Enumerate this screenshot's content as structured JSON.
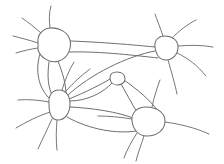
{
  "figure": {
    "kind": "line-drawing",
    "width": 224,
    "height": 164,
    "background_color": "#ffffff",
    "ink_color": "#6e6e70",
    "stroke_width": 1.05
  },
  "nodes": [
    {
      "id": "node-top-left",
      "label": "",
      "cx": 52,
      "cy": 45,
      "rx": 18,
      "ry": 16,
      "shape": "rounded-polygon",
      "path": "M 38 43 C 37 35 42 29 50 28 C 58 27 68 32 70 40 C 72 48 68 58 59 61 C 50 64 41 58 38 50 Z"
    },
    {
      "id": "node-top-right",
      "label": "",
      "cx": 166,
      "cy": 48,
      "rx": 13,
      "ry": 12,
      "shape": "rounded-polygon",
      "path": "M 155 47 C 154 41 158 36 165 36 C 172 36 178 40 178 47 C 178 54 173 60 166 60 C 159 60 156 54 155 47 Z"
    },
    {
      "id": "node-left-middle",
      "label": "",
      "cx": 59,
      "cy": 106,
      "rx": 12,
      "ry": 15,
      "shape": "rounded-polygon",
      "path": "M 49 104 C 48 96 52 90 59 90 C 66 90 70 96 70 104 C 70 113 65 120 58 120 C 51 120 49 112 49 104 Z"
    },
    {
      "id": "node-bottom-right",
      "label": "",
      "cx": 148,
      "cy": 122,
      "rx": 17,
      "ry": 13,
      "shape": "rounded-polygon",
      "path": "M 132 121 C 131 113 137 107 146 107 C 156 107 165 112 165 121 C 165 130 157 136 147 136 C 138 136 133 129 132 121 Z"
    },
    {
      "id": "node-center-small",
      "label": "",
      "cx": 117,
      "cy": 78,
      "rx": 7,
      "ry": 6,
      "shape": "small-circle",
      "path": "M 110 78 C 110 74 113 72 117 72 C 122 72 125 75 125 79 C 125 83 121 85 117 85 C 113 85 110 82 110 78 Z"
    }
  ],
  "edges": [
    {
      "id": "edge-tl-tr-upper",
      "from": "node-top-left",
      "to": "node-top-right",
      "path": "M 70 41 C 100 42 135 45 155 47"
    },
    {
      "id": "edge-tl-tr-lower",
      "from": "node-top-left",
      "to": "node-top-right",
      "path": "M 69 52 C 100 51 140 56 158 58"
    },
    {
      "id": "edge-tl-lm-left",
      "from": "node-top-left",
      "to": "node-left-middle",
      "path": "M 40 54 C 35 70 38 88 50 99"
    },
    {
      "id": "edge-tl-lm-right",
      "from": "node-top-left",
      "to": "node-left-middle",
      "path": "M 58 61 C 63 74 66 84 66 95"
    },
    {
      "id": "edge-tl-lm-mid",
      "from": "node-top-left",
      "to": "node-left-middle",
      "path": "M 49 62 C 47 76 48 88 53 97"
    },
    {
      "id": "edge-lm-center",
      "from": "node-left-middle",
      "to": "node-center-small",
      "path": "M 69 99 C 86 92 102 84 110 79"
    },
    {
      "id": "edge-lm-tr-sweep",
      "from": "node-left-middle",
      "to": "node-top-right",
      "path": "M 67 96 C 90 74 128 56 155 51"
    },
    {
      "id": "edge-center-br",
      "from": "node-center-small",
      "to": "node-bottom-right",
      "path": "M 121 84 C 128 96 134 108 139 115"
    },
    {
      "id": "edge-center-br-outer",
      "from": "node-center-small",
      "to": "node-bottom-right",
      "path": "M 124 80 C 138 90 150 100 158 111"
    },
    {
      "id": "edge-lm-br-upper",
      "from": "node-left-middle",
      "to": "node-bottom-right",
      "path": "M 70 107 C 92 108 118 112 133 118"
    },
    {
      "id": "edge-lm-br-lower",
      "from": "node-left-middle",
      "to": "node-bottom-right",
      "path": "M 67 117 C 90 130 118 134 136 131"
    },
    {
      "id": "edge-lm-center-low",
      "from": "node-left-middle",
      "to": "node-center-small",
      "path": "M 70 101 C 88 101 104 92 112 83"
    }
  ],
  "tails": [
    {
      "id": "tail-tl-up",
      "from": "node-top-left",
      "path": "M 50 28 C 49 20 49 12 51 6"
    },
    {
      "id": "tail-tl-upleft",
      "from": "node-top-left",
      "path": "M 41 33 C 34 27 28 22 22 18"
    },
    {
      "id": "tail-tl-left",
      "from": "node-top-left",
      "path": "M 38 43 C 29 40 21 38 13 36"
    },
    {
      "id": "tail-tl-leftlow",
      "from": "node-top-left",
      "path": "M 38 48 C 30 49 23 51 16 53"
    },
    {
      "id": "tail-tr-up",
      "from": "node-top-right",
      "path": "M 163 36 C 160 27 157 20 155 14"
    },
    {
      "id": "tail-tr-upright",
      "from": "node-top-right",
      "path": "M 172 38 C 180 30 188 24 196 20"
    },
    {
      "id": "tail-tr-right",
      "from": "node-top-right",
      "path": "M 178 46 C 190 45 202 45 213 47"
    },
    {
      "id": "tail-tr-rightlow",
      "from": "node-top-right",
      "path": "M 177 53 C 188 58 198 66 206 76"
    },
    {
      "id": "tail-tr-down",
      "from": "node-top-right",
      "path": "M 168 60 C 172 74 175 84 177 94"
    },
    {
      "id": "tail-lm-left",
      "from": "node-left-middle",
      "path": "M 49 102 C 38 100 28 99 18 100"
    },
    {
      "id": "tail-lm-leftlow",
      "from": "node-left-middle",
      "path": "M 50 112 C 38 116 26 122 16 128"
    },
    {
      "id": "tail-lm-down",
      "from": "node-left-middle",
      "path": "M 57 120 C 56 131 56 141 57 150"
    },
    {
      "id": "tail-lm-downleft",
      "from": "node-left-middle",
      "path": "M 52 119 C 47 130 42 140 38 149"
    },
    {
      "id": "tail-lm-upright",
      "from": "node-left-middle",
      "path": "M 66 91 C 74 82 82 75 90 69"
    },
    {
      "id": "tail-lm-upright2",
      "from": "node-left-middle",
      "path": "M 62 90 C 65 80 69 70 74 62"
    },
    {
      "id": "tail-br-down",
      "from": "node-bottom-right",
      "path": "M 144 136 C 141 145 138 153 136 161"
    },
    {
      "id": "tail-br-downleft",
      "from": "node-bottom-right",
      "path": "M 137 133 C 131 142 127 150 124 158"
    },
    {
      "id": "tail-br-right",
      "from": "node-bottom-right",
      "path": "M 165 122 C 180 124 196 128 209 134"
    },
    {
      "id": "tail-br-up",
      "from": "node-bottom-right",
      "path": "M 152 107 C 154 97 157 88 160 80"
    },
    {
      "id": "tail-br-left",
      "from": "node-bottom-right",
      "path": "M 132 119 C 120 117 108 116 98 116"
    }
  ],
  "counts": {
    "node_count": 5,
    "edge_count": 12,
    "tail_count": 20
  }
}
